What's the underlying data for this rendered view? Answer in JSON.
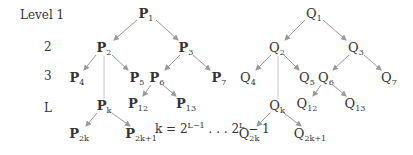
{
  "levels": [
    {
      "label": "Level 1",
      "x": 20,
      "y": 9
    },
    {
      "label": "2",
      "x": 44,
      "y": 41
    },
    {
      "label": "3",
      "x": 44,
      "y": 70
    },
    {
      "label": "L",
      "x": 44,
      "y": 102
    }
  ],
  "trees": {
    "P": {
      "nodes": [
        {
          "id": "1",
          "base": "P",
          "sub": "1",
          "x": 146,
          "y": 15
        },
        {
          "id": "2",
          "base": "P",
          "sub": "2",
          "x": 104,
          "y": 49
        },
        {
          "id": "3",
          "base": "P",
          "sub": "3",
          "x": 186,
          "y": 49
        },
        {
          "id": "4",
          "base": "P",
          "sub": "4",
          "x": 77,
          "y": 79
        },
        {
          "id": "5",
          "base": "P",
          "sub": "5",
          "x": 137,
          "y": 79
        },
        {
          "id": "6",
          "base": "P",
          "sub": "6",
          "x": 157,
          "y": 79
        },
        {
          "id": "7",
          "base": "P",
          "sub": "7",
          "x": 219,
          "y": 79
        },
        {
          "id": "k",
          "base": "P",
          "sub": "k",
          "x": 104,
          "y": 107
        },
        {
          "id": "12",
          "base": "P",
          "sub": "12",
          "x": 138,
          "y": 105
        },
        {
          "id": "13",
          "base": "P",
          "sub": "13",
          "x": 186,
          "y": 105
        },
        {
          "id": "2k",
          "base": "P",
          "sub": "2k",
          "x": 79,
          "y": 135
        },
        {
          "id": "2k1",
          "base": "P",
          "sub": "2k+1",
          "x": 141,
          "y": 135
        }
      ]
    },
    "Q": {
      "nodes": [
        {
          "id": "1",
          "base": "Q",
          "sub": "1",
          "x": 314,
          "y": 15
        },
        {
          "id": "2",
          "base": "Q",
          "sub": "2",
          "x": 277,
          "y": 49
        },
        {
          "id": "3",
          "base": "Q",
          "sub": "3",
          "x": 356,
          "y": 49
        },
        {
          "id": "4",
          "base": "Q",
          "sub": "4",
          "x": 248,
          "y": 79
        },
        {
          "id": "5",
          "base": "Q",
          "sub": "5",
          "x": 307,
          "y": 79
        },
        {
          "id": "6",
          "base": "Q",
          "sub": "6",
          "x": 326,
          "y": 79
        },
        {
          "id": "7",
          "base": "Q",
          "sub": "7",
          "x": 389,
          "y": 79
        },
        {
          "id": "k",
          "base": "Q",
          "sub": "k",
          "x": 277,
          "y": 107
        },
        {
          "id": "12",
          "base": "Q",
          "sub": "12",
          "x": 307,
          "y": 105
        },
        {
          "id": "13",
          "base": "Q",
          "sub": "13",
          "x": 355,
          "y": 105
        },
        {
          "id": "2k",
          "base": "Q",
          "sub": "2k",
          "x": 249,
          "y": 135
        },
        {
          "id": "2k1",
          "base": "Q",
          "sub": "2k+1",
          "x": 310,
          "y": 135
        }
      ]
    }
  },
  "edges": [
    [
      137,
      20,
      114,
      40
    ],
    [
      156,
      20,
      178,
      40
    ],
    [
      96,
      55,
      84,
      70
    ],
    [
      112,
      55,
      128,
      70
    ],
    [
      180,
      55,
      165,
      70
    ],
    [
      193,
      55,
      210,
      70
    ],
    [
      151,
      85,
      143,
      96
    ],
    [
      163,
      85,
      176,
      96
    ],
    [
      97,
      113,
      86,
      126
    ],
    [
      112,
      113,
      130,
      126
    ],
    [
      305,
      20,
      285,
      40
    ],
    [
      323,
      20,
      346,
      40
    ],
    [
      271,
      55,
      256,
      70
    ],
    [
      284,
      55,
      299,
      70
    ],
    [
      349,
      55,
      333,
      70
    ],
    [
      364,
      55,
      381,
      70
    ],
    [
      321,
      85,
      313,
      96
    ],
    [
      333,
      85,
      346,
      96
    ],
    [
      270,
      113,
      257,
      126
    ],
    [
      284,
      113,
      301,
      126
    ]
  ],
  "dashed": [
    [
      104,
      56,
      104,
      99
    ],
    [
      278,
      56,
      278,
      99
    ]
  ],
  "formula": {
    "prefix": "k = 2",
    "sup1": "L−1",
    "mid": " . . . 2",
    "sup2": "L",
    "suffix": " − 1",
    "x": 155,
    "y": 122
  },
  "colors": {
    "edge": "#9a9a9a",
    "text": "#333333"
  }
}
